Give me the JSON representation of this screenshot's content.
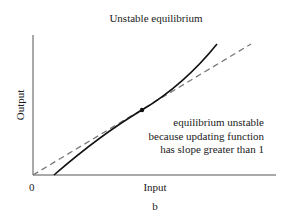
{
  "figure": {
    "title": "Unstable equilibrium",
    "ylabel": "Output",
    "xlabel": "Input",
    "origin_label": "0",
    "panel_label": "b",
    "annotation": {
      "lines": [
        "equilibrium unstable",
        "because updating function",
        "has slope greater than 1"
      ]
    },
    "colors": {
      "axis": "#555555",
      "updating_function": "#111111",
      "diagonal": "#777777",
      "equilibrium_point": "#111111"
    }
  },
  "diagram": {
    "type": "cobweb-equilibrium",
    "elements": [
      {
        "id": "diagonal",
        "style": "dashed",
        "description": "Output = Input (slope 1)"
      },
      {
        "id": "updating_function",
        "style": "solid",
        "description": "Updating function with slope greater than 1"
      },
      {
        "id": "equilibrium_point",
        "style": "dot",
        "description": "Intersection of updating function and diagonal"
      }
    ]
  }
}
